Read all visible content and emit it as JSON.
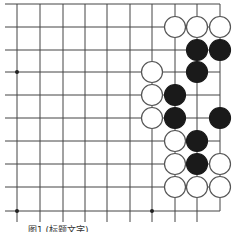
{
  "diagram": {
    "type": "go-board-fragment",
    "grid": {
      "cols": 10,
      "rows": 10,
      "x": [
        17,
        40,
        63,
        85,
        107,
        130,
        152,
        175,
        197,
        220
      ],
      "y": [
        4,
        27,
        50,
        72,
        95,
        118,
        141,
        164,
        187,
        211
      ],
      "line_color": "#444444",
      "h_line_x_start": 5,
      "v_line_y_end": 222
    },
    "star_points": [
      {
        "col": 0,
        "row": 3
      },
      {
        "col": 0,
        "row": 9
      },
      {
        "col": 6,
        "row": 9
      }
    ],
    "stone_radius": 10.5,
    "stones": [
      {
        "color": "white",
        "col": 7,
        "row": 1
      },
      {
        "color": "white",
        "col": 8,
        "row": 1
      },
      {
        "color": "white",
        "col": 9,
        "row": 1
      },
      {
        "color": "black",
        "col": 8,
        "row": 2
      },
      {
        "color": "black",
        "col": 9,
        "row": 2
      },
      {
        "color": "white",
        "col": 6,
        "row": 3
      },
      {
        "color": "black",
        "col": 8,
        "row": 3
      },
      {
        "color": "white",
        "col": 6,
        "row": 4
      },
      {
        "color": "black",
        "col": 7,
        "row": 4
      },
      {
        "color": "white",
        "col": 6,
        "row": 5
      },
      {
        "color": "black",
        "col": 7,
        "row": 5
      },
      {
        "color": "black",
        "col": 9,
        "row": 5
      },
      {
        "color": "white",
        "col": 7,
        "row": 6
      },
      {
        "color": "black",
        "col": 8,
        "row": 6
      },
      {
        "color": "white",
        "col": 7,
        "row": 7
      },
      {
        "color": "black",
        "col": 8,
        "row": 7
      },
      {
        "color": "white",
        "col": 9,
        "row": 7
      },
      {
        "color": "white",
        "col": 7,
        "row": 8
      },
      {
        "color": "white",
        "col": 8,
        "row": 8
      },
      {
        "color": "white",
        "col": 9,
        "row": 8
      }
    ],
    "colors": {
      "black_stone": "#1a1a1a",
      "white_stone": "#ffffff",
      "stone_outline": "#555555"
    }
  },
  "caption": "图1  (标题文字)"
}
